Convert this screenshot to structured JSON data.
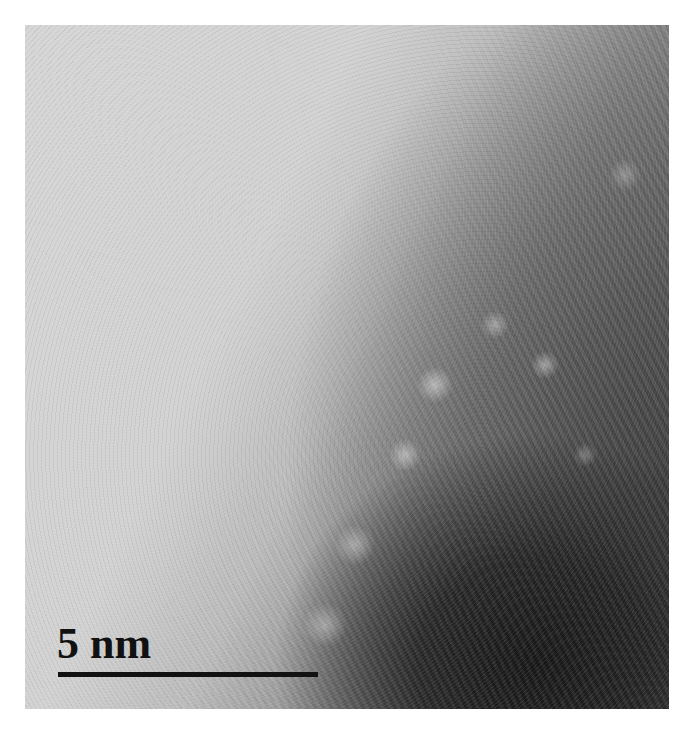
{
  "image": {
    "type": "TEM micrograph",
    "description": "High-resolution electron micrograph showing lattice fringes of a dark nanoparticle at lower right against a lighter amorphous background",
    "colors": {
      "background_light": "#d2d2d2",
      "particle_dark": "#1e1e1e",
      "scale_bar": "#111111",
      "page": "#ffffff"
    }
  },
  "scale_bar": {
    "label": "5 nm",
    "length_px": 260
  }
}
